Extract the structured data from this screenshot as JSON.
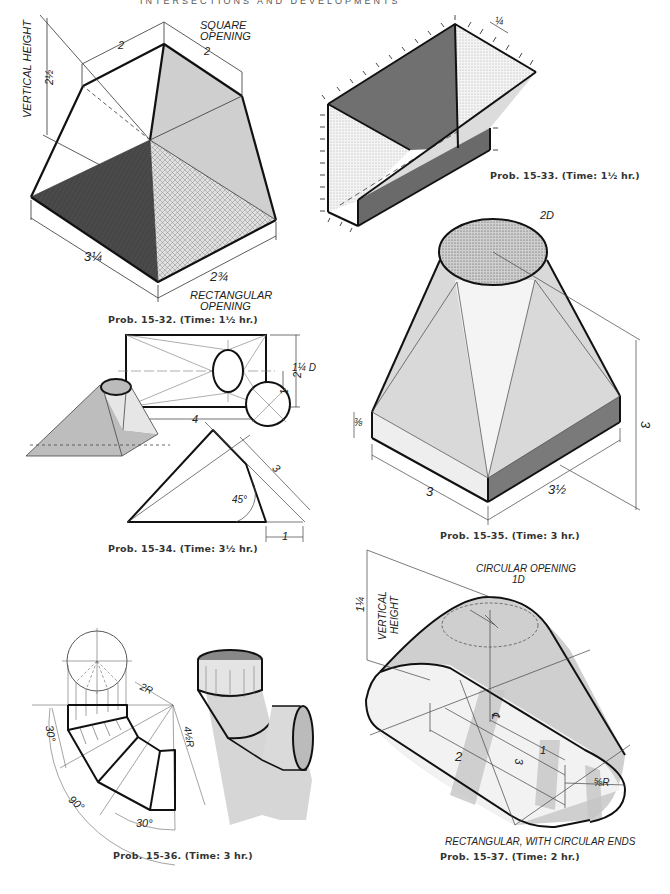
{
  "page": {
    "running_head": "INTERSECTIONS AND DEVELOPMENTS",
    "background": "#ffffff",
    "ink_color": "#1a1a1a",
    "shade_dark": "#5a5a5a",
    "shade_mid": "#bdbdbd",
    "shade_light": "#e4e4e4"
  },
  "problems": [
    {
      "id": "15-32",
      "caption": "Prob. 15-32. (Time: 1½ hr.)",
      "labels": {
        "vertical_height": "VERTICAL HEIGHT",
        "height_value": "2½",
        "square_opening": "SQUARE OPENING",
        "square_line1": "SQUARE",
        "square_line2": "OPENING",
        "top_side_a": "2",
        "top_side_b": "2",
        "base_a": "3¼",
        "base_b": "2¾",
        "rect_line1": "RECTANGULAR",
        "rect_line2": "OPENING"
      }
    },
    {
      "id": "15-33",
      "caption": "Prob. 15-33. (Time: 1½ hr.)",
      "labels": {
        "thickness": "¼"
      }
    },
    {
      "id": "15-34",
      "caption": "Prob. 15-34. (Time: 3½ hr.)",
      "labels": {
        "plan_width": "4",
        "plan_height": "2",
        "plan_offset": "1",
        "circle_diameter": "1¼ D",
        "slant_length": "3",
        "angle": "45°",
        "base_offset": "1"
      }
    },
    {
      "id": "15-35",
      "caption": "Prob. 15-35. (Time: 3 hr.)",
      "labels": {
        "top_diameter": "2D",
        "base_thickness": "⅜",
        "base_a": "3",
        "base_b": "3½",
        "height": "3"
      }
    },
    {
      "id": "15-36",
      "caption": "Prob. 15-36. (Time: 3 hr.)",
      "labels": {
        "inner_radius": "2R",
        "outer_radius": "4½R",
        "segment_angle_top": "30°",
        "segment_angle_bottom": "30°",
        "total_angle": "90°"
      }
    },
    {
      "id": "15-37",
      "caption": "Prob. 15-37. (Time: 2 hr.)",
      "labels": {
        "vertical_height_line1": "VERTICAL",
        "vertical_height_line2": "HEIGHT",
        "height_value": "1¼",
        "circ_line1": "CIRCULAR OPENING",
        "circ_line2": "1D",
        "centerline": "℄",
        "dim_1": "1",
        "dim_3": "3",
        "dim_2": "2",
        "end_radius": "⅝R",
        "rect_ends": "RECTANGULAR, WITH CIRCULAR ENDS"
      }
    }
  ]
}
